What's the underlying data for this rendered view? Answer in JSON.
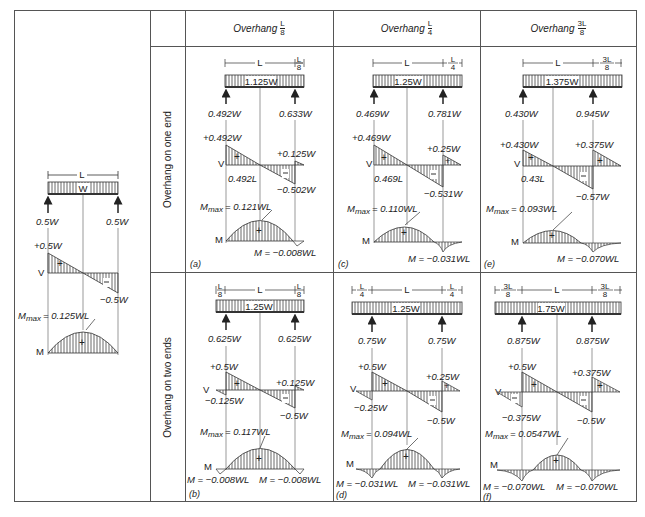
{
  "figure": {
    "left_panel": {
      "span_label": "L",
      "load_label": "W",
      "reactions": [
        "0.5W",
        "0.5W"
      ],
      "shear": {
        "axis": "V",
        "max": "+0.5W",
        "min": "−0.5W"
      },
      "moment": {
        "axis": "M",
        "mmax_prefix": "M",
        "mmax_sub": "max",
        "mmax_value": "= 0.125WL"
      }
    },
    "columns": [
      {
        "header": "Overhang",
        "frac_num": "L",
        "frac_den": "8"
      },
      {
        "header": "Overhang",
        "frac_num": "L",
        "frac_den": "4"
      },
      {
        "header": "Overhang",
        "frac_num": "3L",
        "frac_den": "8"
      }
    ],
    "rows": [
      {
        "label": "Overhang on one end"
      },
      {
        "label": "Overhang on two ends"
      }
    ],
    "cells": [
      {
        "tag": "(a)",
        "span": "L",
        "overhang_left": "",
        "overhang_right_num": "L",
        "overhang_right_den": "8",
        "load": "1.125W",
        "reaction_left": "0.492W",
        "reaction_right": "0.633W",
        "v_max": "+0.492W",
        "v_right_pos": "+0.125W",
        "v_min": "−0.502W",
        "v_left_neg": "",
        "zero_loc": "0.492L",
        "mmax_value": "= 0.121WL",
        "m_right": "M = −0.008WL",
        "m_left": ""
      },
      {
        "tag": "(c)",
        "span": "L",
        "overhang_left": "",
        "overhang_right_num": "L",
        "overhang_right_den": "4",
        "load": "1.25W",
        "reaction_left": "0.469W",
        "reaction_right": "0.781W",
        "v_max": "+0.469W",
        "v_right_pos": "+0.25W",
        "v_min": "−0.531W",
        "v_left_neg": "",
        "zero_loc": "0.469L",
        "mmax_value": "= 0.110WL",
        "m_right": "M = −0.031WL",
        "m_left": ""
      },
      {
        "tag": "(e)",
        "span": "L",
        "overhang_left": "",
        "overhang_right_num": "3L",
        "overhang_right_den": "8",
        "load": "1.375W",
        "reaction_left": "0.430W",
        "reaction_right": "0.945W",
        "v_max": "+0.430W",
        "v_right_pos": "+0.375W",
        "v_min": "−0.57W",
        "v_left_neg": "",
        "zero_loc": "0.43L",
        "mmax_value": "= 0.093WL",
        "m_right": "M = −0.070WL",
        "m_left": ""
      },
      {
        "tag": "(b)",
        "span": "L",
        "overhang_left_num": "L",
        "overhang_left_den": "8",
        "overhang_right_num": "L",
        "overhang_right_den": "8",
        "load": "1.25W",
        "reaction_left": "0.625W",
        "reaction_right": "0.625W",
        "v_max": "+0.5W",
        "v_right_pos": "+0.125W",
        "v_min": "−0.5W",
        "v_left_neg": "−0.125W",
        "mmax_value": "= 0.117WL",
        "m_left": "M = −0.008WL",
        "m_right": "M = −0.008WL"
      },
      {
        "tag": "(d)",
        "span": "L",
        "overhang_left_num": "L",
        "overhang_left_den": "4",
        "overhang_right_num": "L",
        "overhang_right_den": "4",
        "load": "1.25W",
        "reaction_left": "0.75W",
        "reaction_right": "0.75W",
        "v_max": "+0.5W",
        "v_right_pos": "+0.25W",
        "v_min": "−0.5W",
        "v_left_neg": "−0.25W",
        "mmax_value": "= 0.094WL",
        "m_left": "M = −0.031WL",
        "m_right": "M = −0.031WL"
      },
      {
        "tag": "(f)",
        "span": "L",
        "overhang_left_num": "3L",
        "overhang_left_den": "8",
        "overhang_right_num": "3L",
        "overhang_right_den": "8",
        "load": "1.75W",
        "reaction_left": "0.875W",
        "reaction_right": "0.875W",
        "v_max": "+0.5W",
        "v_right_pos": "+0.375W",
        "v_min": "−0.5W",
        "v_left_neg": "−0.375W",
        "mmax_value": "= 0.0547WL",
        "m_left": "M = −0.070WL",
        "m_right": "M = −0.070WL"
      }
    ],
    "common": {
      "shear_axis": "V",
      "moment_axis": "M",
      "mmax_prefix": "M",
      "mmax_sub": "max",
      "plus": "+",
      "minus": "−"
    }
  }
}
